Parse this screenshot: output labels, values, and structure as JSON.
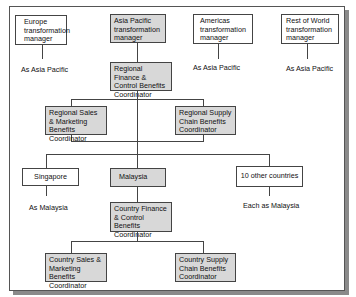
{
  "diagram": {
    "top_managers": [
      {
        "id": "europe",
        "label": "Europe transformation manager",
        "highlighted": false,
        "note": "As Asia Pacific"
      },
      {
        "id": "asia-pacific",
        "label": "Asia Pacific transformation manager",
        "highlighted": true
      },
      {
        "id": "americas",
        "label": "Americas transformation manager",
        "highlighted": false,
        "note": "As Asia Pacific"
      },
      {
        "id": "rest-of-world",
        "label": "Rest of World transformation manager",
        "highlighted": false,
        "note": "As Asia Pacific"
      }
    ],
    "regional": {
      "finance": "Regional Finance & Control Benefits Coordinator",
      "sales": "Regional Sales & Marketing Benefits Coordinator",
      "supply": "Regional Supply Chain Benefits Coordinator"
    },
    "countries": [
      {
        "id": "singapore",
        "label": "Singapore",
        "highlighted": false,
        "note": "As Malaysia"
      },
      {
        "id": "malaysia",
        "label": "Malaysia",
        "highlighted": true
      },
      {
        "id": "other",
        "label": "10 other countries",
        "highlighted": false,
        "note": "Each as Malaysia"
      }
    ],
    "country_level": {
      "finance": "Country Finance & Control Benefits Coordinator",
      "sales": "Country Sales & Marketing Benefits Coordinator",
      "supply": "Country Supply Chain Benefits Coordinator"
    },
    "colors": {
      "highlight_fill": "#d8d8d8",
      "border": "#444444",
      "shadow": "#8a8a8a"
    }
  }
}
